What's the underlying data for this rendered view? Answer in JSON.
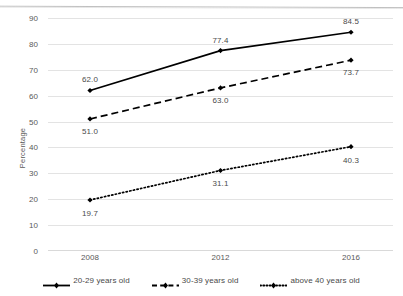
{
  "chart_data": {
    "type": "line",
    "title": "",
    "xlabel": "",
    "ylabel": "Percentage",
    "categories": [
      "2008",
      "2012",
      "2016"
    ],
    "x": [
      2008,
      2012,
      2016
    ],
    "ylim": [
      0,
      90
    ],
    "ytick_step": 10,
    "yticks": [
      "90",
      "80",
      "70",
      "60",
      "50",
      "40",
      "30",
      "20",
      "10",
      "0"
    ],
    "grid": true,
    "legend_position": "bottom",
    "series": [
      {
        "name": "20-29 years old",
        "values": [
          62.0,
          77.4,
          84.5
        ],
        "labels": [
          "62.0",
          "77.4",
          "84.5"
        ],
        "style": "solid",
        "color": "#000000",
        "marker": "diamond"
      },
      {
        "name": "30-39 years old",
        "values": [
          51.0,
          63.0,
          73.7
        ],
        "labels": [
          "51.0",
          "63.0",
          "73.7"
        ],
        "style": "dashed",
        "color": "#000000",
        "marker": "diamond"
      },
      {
        "name": "above 40 years old",
        "values": [
          19.7,
          31.1,
          40.3
        ],
        "labels": [
          "19.7",
          "31.1",
          "40.3"
        ],
        "style": "dotted",
        "color": "#000000",
        "marker": "diamond"
      }
    ]
  },
  "axis": {
    "y_title": "Percentage",
    "y_ticks": [
      "90",
      "80",
      "70",
      "60",
      "50",
      "40",
      "30",
      "20",
      "10",
      "0"
    ],
    "x_ticks": [
      "2008",
      "2012",
      "2016"
    ]
  },
  "labels": {
    "s1": [
      "62.0",
      "77.4",
      "84.5"
    ],
    "s2": [
      "51.0",
      "63.0",
      "73.7"
    ],
    "s3": [
      "19.7",
      "31.1",
      "40.3"
    ]
  },
  "legend": {
    "items": [
      {
        "label": "20-29 years old"
      },
      {
        "label": "30-39 years old"
      },
      {
        "label": "above 40 years old"
      }
    ]
  },
  "colors": {
    "series": "#000000",
    "grid": "#e3e3e3",
    "text": "#595959"
  }
}
